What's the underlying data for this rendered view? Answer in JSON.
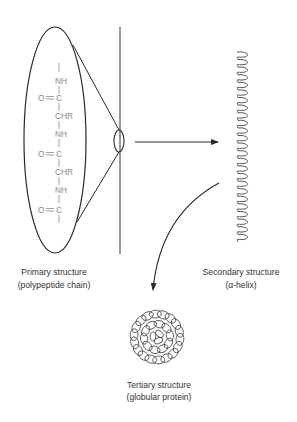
{
  "diagram": {
    "colors": {
      "line": "#2a2a2a",
      "chem_text": "#8a8a8a",
      "label_text": "#333333",
      "background": "#ffffff"
    },
    "primary": {
      "label_line1": "Primary structure",
      "label_line2": "(polypeptide chain)",
      "chain": [
        {
          "type": "bond"
        },
        {
          "type": "atom",
          "text": "NH"
        },
        {
          "type": "bond"
        },
        {
          "type": "carbonyl",
          "left": "O",
          "bond": "=",
          "text": "C"
        },
        {
          "type": "bond"
        },
        {
          "type": "atom",
          "text": "CHR"
        },
        {
          "type": "bond"
        },
        {
          "type": "atom",
          "text": "NH"
        },
        {
          "type": "bond"
        },
        {
          "type": "carbonyl",
          "left": "O",
          "bond": "=",
          "text": "C"
        },
        {
          "type": "bond"
        },
        {
          "type": "atom",
          "text": "CHR"
        },
        {
          "type": "bond"
        },
        {
          "type": "atom",
          "text": "NH"
        },
        {
          "type": "bond"
        },
        {
          "type": "carbonyl",
          "left": "O",
          "bond": "=",
          "text": "C"
        },
        {
          "type": "bond"
        }
      ],
      "chem_text": {
        "nh1": "NH",
        "oc1_o": "O",
        "oc1_c": "C",
        "chr1": "CHR",
        "nh2": "NH",
        "oc2_o": "O",
        "oc2_c": "C",
        "chr2": "CHR",
        "nh3": "NH",
        "oc3_o": "O",
        "oc3_c": "C"
      }
    },
    "secondary": {
      "label_line1": "Secondary structure",
      "label_line2": "(α-helix)"
    },
    "tertiary": {
      "label_line1": "Tertiary structure",
      "label_line2": "(globular protein)"
    },
    "arrows": [
      {
        "from": "primary",
        "to": "secondary",
        "style": "straight"
      },
      {
        "from": "secondary",
        "to": "tertiary",
        "style": "curved"
      }
    ]
  }
}
